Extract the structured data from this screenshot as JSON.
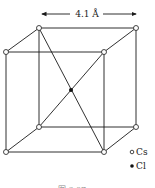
{
  "diagram": {
    "dimension_label": "4.1 Å",
    "legend": [
      {
        "symbol": "open-circle",
        "label": "Cs"
      },
      {
        "symbol": "filled-circle",
        "label": "Cl"
      }
    ],
    "caption": "图 6.07",
    "colors": {
      "line": "#1a1a1a",
      "background": "#ffffff"
    }
  }
}
